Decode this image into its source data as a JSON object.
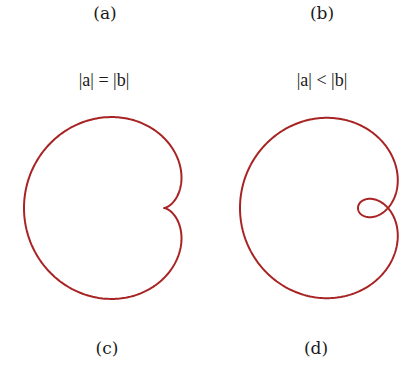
{
  "figure": {
    "labels_top": [
      {
        "id": "a",
        "text": "(a)",
        "x": 105,
        "y": 3
      },
      {
        "id": "b",
        "text": "(b)",
        "x": 322,
        "y": 3
      }
    ],
    "labels_bottom": [
      {
        "id": "c",
        "text": "(c)",
        "x": 107,
        "y": 338
      },
      {
        "id": "d",
        "text": "(d)",
        "x": 316,
        "y": 338
      }
    ],
    "conditions": [
      {
        "id": "cond-left",
        "text": "|a| = |b|",
        "x": 104,
        "y": 70
      },
      {
        "id": "cond-right",
        "text": "|a| < |b|",
        "x": 322,
        "y": 70
      }
    ],
    "curves": [
      {
        "id": "curve-cardioid",
        "type": "limacon",
        "cx": 164,
        "cy": 208,
        "a": 70,
        "b": 70,
        "description": "cardioid with inward cusp on right"
      },
      {
        "id": "curve-limacon-loop",
        "type": "limacon",
        "cx": 388,
        "cy": 208,
        "a": 59,
        "b": 89,
        "description": "limacon with inner loop on right"
      }
    ],
    "stroke_color": "#a82424",
    "stroke_width": 2
  }
}
